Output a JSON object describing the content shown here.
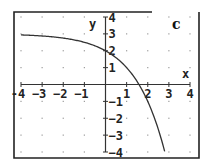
{
  "panel_label": "c",
  "colors": {
    "frame": "#222222",
    "axis": "#333333",
    "curve": "#333333",
    "grid_dot": "#9a9a9a",
    "background": "#ffffff"
  },
  "chart_data": {
    "type": "line",
    "title": "",
    "panel_label": "c",
    "xlabel": "x",
    "ylabel": "y",
    "xlim": [
      -4,
      4
    ],
    "ylim": [
      -4,
      4
    ],
    "x_ticks": [
      -4,
      -3,
      -2,
      -1,
      1,
      2,
      3,
      4
    ],
    "y_ticks": [
      -4,
      -3,
      -2,
      -1,
      1,
      2,
      3,
      4
    ],
    "x_tick_labels": [
      "-4",
      "−3",
      "−2",
      "−1",
      "1",
      "2",
      "3",
      "4"
    ],
    "y_tick_labels": [
      "−4",
      "−3",
      "−2",
      "−1",
      "1",
      "2",
      "3",
      "4"
    ],
    "grid": "dots",
    "legend": null,
    "series": [
      {
        "name": "curve",
        "description": "decreasing curve approaching y=3 on the left, through (0,2), crossing x-axis near x=1.6, reaching y=-4 near x=2.8",
        "x": [
          -4,
          -3,
          -2,
          -1,
          0,
          0.5,
          1,
          1.5,
          1.6,
          2,
          2.5,
          2.8
        ],
        "y": [
          2.94,
          2.88,
          2.75,
          2.5,
          2,
          1.59,
          1,
          0.17,
          -0.03,
          -1,
          -2.66,
          -3.96
        ]
      }
    ]
  }
}
